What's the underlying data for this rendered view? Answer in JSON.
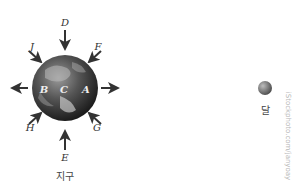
{
  "diagram": {
    "earth": {
      "label": "지구",
      "surface_points": {
        "a": "A",
        "b": "B",
        "c": "C"
      },
      "center": [
        65,
        88
      ],
      "radius": 33
    },
    "moon": {
      "label": "달",
      "center": [
        265,
        88
      ],
      "radius": 7
    },
    "arrows": [
      {
        "label": "D",
        "direction": "down-toward-earth",
        "position": "top"
      },
      {
        "label": "E",
        "direction": "up-toward-earth",
        "position": "bottom"
      },
      {
        "label": "F",
        "direction": "toward-earth",
        "position": "top-right"
      },
      {
        "label": "G",
        "direction": "toward-earth",
        "position": "bottom-right"
      },
      {
        "label": "H",
        "direction": "toward-earth",
        "position": "bottom-left"
      },
      {
        "label": "J",
        "direction": "toward-earth",
        "position": "top-left"
      },
      {
        "label": "",
        "direction": "away-left",
        "position": "left"
      },
      {
        "label": "",
        "direction": "away-right",
        "position": "right"
      }
    ],
    "watermark": "iStockphoto.com/janyoay"
  }
}
